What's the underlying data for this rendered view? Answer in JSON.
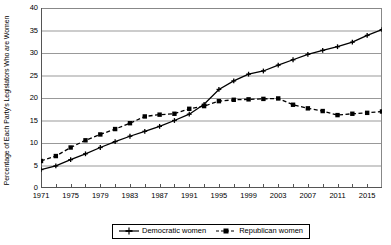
{
  "chart_data": {
    "type": "line",
    "title": "",
    "xlabel": "",
    "ylabel": "Percentage of Each Party's Legislators Who are Women",
    "xlim": [
      1971,
      2017
    ],
    "ylim": [
      0,
      40
    ],
    "ytick_labels": [
      "0",
      "5",
      "10",
      "15",
      "20",
      "25",
      "30",
      "35",
      "40"
    ],
    "ytick_values": [
      0,
      5,
      10,
      15,
      20,
      25,
      30,
      35,
      40
    ],
    "xtick_labels": [
      "1971",
      "1975",
      "1979",
      "1983",
      "1987",
      "1991",
      "1995",
      "1999",
      "2003",
      "2007",
      "2011",
      "2015"
    ],
    "xtick_values": [
      1971,
      1975,
      1979,
      1983,
      1987,
      1991,
      1995,
      1999,
      2003,
      2007,
      2011,
      2015
    ],
    "grid": "horizontal",
    "legend_position": "bottom-center",
    "x": [
      1971,
      1973,
      1975,
      1977,
      1979,
      1981,
      1983,
      1985,
      1987,
      1989,
      1991,
      1993,
      1995,
      1997,
      1999,
      2001,
      2003,
      2005,
      2007,
      2009,
      2011,
      2013,
      2015,
      2017
    ],
    "series": [
      {
        "name": "Democratic women",
        "marker": "plus",
        "dash": "solid",
        "color": "#000000",
        "values": [
          4.1,
          4.9,
          6.3,
          7.6,
          9.0,
          10.3,
          11.5,
          12.6,
          13.7,
          15.0,
          16.4,
          18.6,
          21.9,
          23.8,
          25.3,
          26.0,
          27.3,
          28.5,
          29.7,
          30.6,
          31.4,
          32.4,
          33.9,
          35.2
        ]
      },
      {
        "name": "Republican women",
        "marker": "square",
        "dash": "dashed",
        "color": "#000000",
        "values": [
          6.0,
          7.1,
          9.0,
          10.6,
          11.9,
          13.1,
          14.4,
          15.9,
          16.3,
          16.5,
          17.6,
          18.2,
          19.3,
          19.6,
          19.7,
          19.8,
          19.9,
          18.5,
          17.7,
          17.1,
          16.2,
          16.5,
          16.7,
          17.0
        ]
      }
    ]
  },
  "legend": {
    "entries": [
      {
        "label": "Democratic women"
      },
      {
        "label": "Republican women"
      }
    ]
  }
}
